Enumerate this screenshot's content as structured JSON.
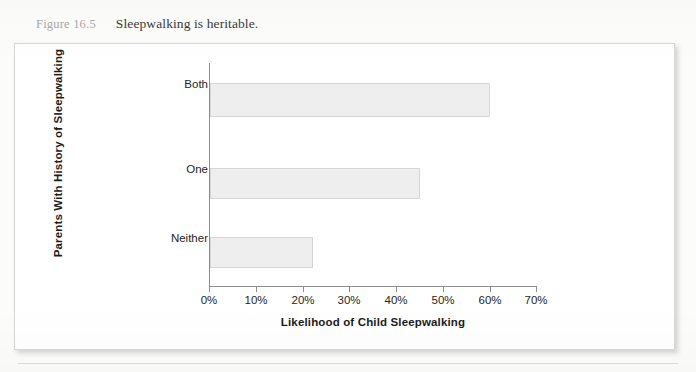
{
  "caption": {
    "figure_number": "Figure 16.5",
    "title": "Sleepwalking is heritable."
  },
  "chart_data": {
    "type": "bar",
    "orientation": "horizontal",
    "title": "Sleepwalking is heritable.",
    "categories": [
      "Both",
      "One",
      "Neither"
    ],
    "values": [
      60,
      45,
      22
    ],
    "xlabel": "Likelihood of Child Sleepwalking",
    "ylabel": "Parents With History of Sleepwalking",
    "xlim": [
      0,
      70
    ],
    "xtick_labels": [
      "0%",
      "10%",
      "20%",
      "30%",
      "40%",
      "50%",
      "60%",
      "70%"
    ],
    "xtick_values": [
      0,
      10,
      20,
      30,
      40,
      50,
      60,
      70
    ],
    "grid": false,
    "legend": null,
    "bar_fill_color": "#eeeeee",
    "bar_border_color": "#d6d6d6",
    "axis_color": "#8d8d8d"
  }
}
